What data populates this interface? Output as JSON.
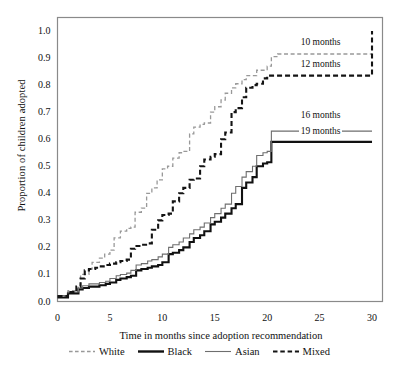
{
  "chart_data": {
    "type": "line",
    "subtype": "step-survival-curve",
    "title": "",
    "xlabel": "Time in months since adoption recommendation",
    "ylabel": "Proportion of children adopted",
    "xlim": [
      0,
      31
    ],
    "ylim": [
      0,
      1.05
    ],
    "xticks": [
      0,
      5,
      10,
      15,
      20,
      25,
      30
    ],
    "yticks": [
      0.0,
      0.1,
      0.2,
      0.3,
      0.4,
      0.5,
      0.6,
      0.7,
      0.8,
      0.9,
      1.0
    ],
    "ytick_labels": [
      "0.0",
      "0.1",
      "0.2",
      "0.3",
      "0.4",
      "0.5",
      "0.6",
      "0.7",
      "0.8",
      "0.9",
      "1.0"
    ],
    "xtick_labels": [
      "0",
      "5",
      "10",
      "15",
      "20",
      "25",
      "30"
    ],
    "grid": false,
    "legend_position": "bottom",
    "series": [
      {
        "name": "White",
        "style": "dashed",
        "color": "#999999",
        "width": 1.3,
        "median_months": 10,
        "final_value": 0.92,
        "points": [
          [
            0,
            0.02
          ],
          [
            1,
            0.04
          ],
          [
            2,
            0.06
          ],
          [
            2.2,
            0.1
          ],
          [
            3,
            0.12
          ],
          [
            3.3,
            0.145
          ],
          [
            4,
            0.16
          ],
          [
            4.5,
            0.175
          ],
          [
            5,
            0.19
          ],
          [
            5.4,
            0.235
          ],
          [
            6,
            0.26
          ],
          [
            6.6,
            0.27
          ],
          [
            7,
            0.275
          ],
          [
            7.4,
            0.33
          ],
          [
            8,
            0.345
          ],
          [
            8.5,
            0.4
          ],
          [
            9,
            0.42
          ],
          [
            9.5,
            0.45
          ],
          [
            10,
            0.49
          ],
          [
            10.5,
            0.5
          ],
          [
            11,
            0.53
          ],
          [
            11.6,
            0.55
          ],
          [
            12,
            0.555
          ],
          [
            12.6,
            0.62
          ],
          [
            13,
            0.645
          ],
          [
            13.6,
            0.655
          ],
          [
            14,
            0.66
          ],
          [
            14.6,
            0.7
          ],
          [
            15,
            0.72
          ],
          [
            15.6,
            0.745
          ],
          [
            16,
            0.77
          ],
          [
            16.6,
            0.79
          ],
          [
            17,
            0.805
          ],
          [
            17.6,
            0.82
          ],
          [
            18,
            0.835
          ],
          [
            19,
            0.855
          ],
          [
            20,
            0.87
          ],
          [
            20.4,
            0.905
          ],
          [
            21,
            0.915
          ],
          [
            25,
            0.915
          ],
          [
            30,
            0.915
          ]
        ]
      },
      {
        "name": "Black",
        "style": "solid",
        "color": "#111111",
        "width": 2.1,
        "median_months": 19,
        "final_value": 0.59,
        "points": [
          [
            0,
            0.015
          ],
          [
            1,
            0.03
          ],
          [
            2,
            0.045
          ],
          [
            2.4,
            0.05
          ],
          [
            3,
            0.055
          ],
          [
            4,
            0.06
          ],
          [
            4.6,
            0.065
          ],
          [
            5,
            0.07
          ],
          [
            5.6,
            0.08
          ],
          [
            6,
            0.085
          ],
          [
            6.6,
            0.09
          ],
          [
            7,
            0.095
          ],
          [
            7.5,
            0.115
          ],
          [
            8,
            0.12
          ],
          [
            8.6,
            0.125
          ],
          [
            9,
            0.13
          ],
          [
            9.6,
            0.135
          ],
          [
            10,
            0.145
          ],
          [
            10.6,
            0.175
          ],
          [
            11,
            0.18
          ],
          [
            11.6,
            0.19
          ],
          [
            12,
            0.2
          ],
          [
            12.6,
            0.22
          ],
          [
            13,
            0.235
          ],
          [
            13.6,
            0.245
          ],
          [
            14,
            0.26
          ],
          [
            14.6,
            0.285
          ],
          [
            15,
            0.295
          ],
          [
            15.6,
            0.31
          ],
          [
            16,
            0.325
          ],
          [
            16.6,
            0.345
          ],
          [
            17,
            0.36
          ],
          [
            17.6,
            0.42
          ],
          [
            18,
            0.44
          ],
          [
            18.6,
            0.46
          ],
          [
            19,
            0.5
          ],
          [
            19.6,
            0.51
          ],
          [
            20,
            0.515
          ],
          [
            20.4,
            0.59
          ],
          [
            25,
            0.59
          ],
          [
            30,
            0.59
          ]
        ]
      },
      {
        "name": "Asian",
        "style": "solid",
        "color": "#6e6e6e",
        "width": 1.1,
        "median_months": 16,
        "final_value": 0.63,
        "points": [
          [
            0,
            0.022
          ],
          [
            1,
            0.035
          ],
          [
            2,
            0.05
          ],
          [
            2.4,
            0.058
          ],
          [
            3,
            0.065
          ],
          [
            4,
            0.07
          ],
          [
            4.6,
            0.075
          ],
          [
            5,
            0.085
          ],
          [
            5.6,
            0.095
          ],
          [
            6,
            0.1
          ],
          [
            6.6,
            0.105
          ],
          [
            7,
            0.115
          ],
          [
            7.5,
            0.135
          ],
          [
            8,
            0.14
          ],
          [
            8.6,
            0.15
          ],
          [
            9,
            0.155
          ],
          [
            9.6,
            0.165
          ],
          [
            10,
            0.175
          ],
          [
            10.6,
            0.2
          ],
          [
            11,
            0.21
          ],
          [
            11.6,
            0.22
          ],
          [
            12,
            0.235
          ],
          [
            12.6,
            0.25
          ],
          [
            13,
            0.265
          ],
          [
            13.6,
            0.275
          ],
          [
            14,
            0.29
          ],
          [
            14.6,
            0.31
          ],
          [
            15,
            0.325
          ],
          [
            15.6,
            0.345
          ],
          [
            16,
            0.36
          ],
          [
            16.6,
            0.4
          ],
          [
            17,
            0.425
          ],
          [
            17.6,
            0.46
          ],
          [
            18,
            0.48
          ],
          [
            18.6,
            0.5
          ],
          [
            19,
            0.54
          ],
          [
            19.6,
            0.55
          ],
          [
            20,
            0.555
          ],
          [
            20.4,
            0.63
          ],
          [
            25,
            0.63
          ],
          [
            30,
            0.63
          ]
        ]
      },
      {
        "name": "Mixed",
        "style": "dashed",
        "color": "#141414",
        "width": 2.1,
        "median_months": 12,
        "final_value": 1.0,
        "points": [
          [
            0,
            0.02
          ],
          [
            1,
            0.035
          ],
          [
            1.8,
            0.055
          ],
          [
            2.2,
            0.085
          ],
          [
            2.6,
            0.115
          ],
          [
            3,
            0.12
          ],
          [
            3.6,
            0.125
          ],
          [
            4,
            0.13
          ],
          [
            4.6,
            0.135
          ],
          [
            5,
            0.14
          ],
          [
            5.6,
            0.145
          ],
          [
            6,
            0.15
          ],
          [
            6.6,
            0.155
          ],
          [
            7,
            0.195
          ],
          [
            7.4,
            0.205
          ],
          [
            8,
            0.21
          ],
          [
            8.6,
            0.215
          ],
          [
            9,
            0.265
          ],
          [
            9.6,
            0.3
          ],
          [
            10,
            0.32
          ],
          [
            10.6,
            0.325
          ],
          [
            11,
            0.37
          ],
          [
            11.6,
            0.4
          ],
          [
            12,
            0.42
          ],
          [
            12.6,
            0.45
          ],
          [
            13,
            0.455
          ],
          [
            13.6,
            0.5
          ],
          [
            14,
            0.525
          ],
          [
            14.6,
            0.535
          ],
          [
            15,
            0.545
          ],
          [
            15.6,
            0.6
          ],
          [
            16,
            0.625
          ],
          [
            16.6,
            0.7
          ],
          [
            17,
            0.715
          ],
          [
            17.6,
            0.755
          ],
          [
            18,
            0.79
          ],
          [
            18.6,
            0.8
          ],
          [
            19,
            0.805
          ],
          [
            19.6,
            0.825
          ],
          [
            20,
            0.835
          ],
          [
            25,
            0.835
          ],
          [
            29.9,
            0.835
          ],
          [
            30,
            1.0
          ]
        ]
      }
    ],
    "annotations": [
      {
        "text": "10 months",
        "series": "White",
        "x": 23.0,
        "y": 0.955
      },
      {
        "text": "12 months",
        "series": "Mixed",
        "x": 23.0,
        "y": 0.875
      },
      {
        "text": "16 months",
        "series": "Asian",
        "x": 23.0,
        "y": 0.685
      },
      {
        "text": "19 months",
        "series": "Black",
        "x": 23.0,
        "y": 0.625
      }
    ]
  },
  "legend": {
    "items": [
      {
        "label": "White",
        "style": "dashed",
        "color": "#999999",
        "width": 1.3
      },
      {
        "label": "Black",
        "style": "solid",
        "color": "#111111",
        "width": 2.4
      },
      {
        "label": "Asian",
        "style": "solid",
        "color": "#6e6e6e",
        "width": 1.1
      },
      {
        "label": "Mixed",
        "style": "dashed",
        "color": "#141414",
        "width": 2.2
      }
    ]
  }
}
